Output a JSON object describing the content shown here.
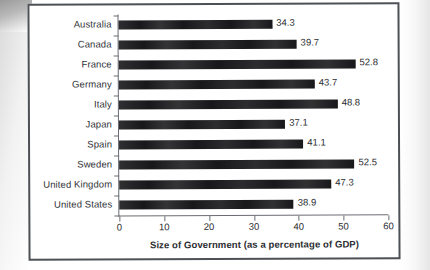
{
  "figure": {
    "border_color": "#4d5055",
    "background": "#ffffff"
  },
  "chart_data": {
    "type": "bar",
    "orientation": "horizontal",
    "title": "",
    "subtitle": "",
    "xlabel": "Size of Government (as a percentage of GDP)",
    "ylabel": "",
    "categories": [
      "Australia",
      "Canada",
      "France",
      "Germany",
      "Italy",
      "Japan",
      "Spain",
      "Sweden",
      "United Kingdom",
      "United States"
    ],
    "values": [
      34.3,
      39.7,
      52.8,
      43.7,
      48.8,
      37.1,
      41.1,
      52.5,
      47.3,
      38.9
    ],
    "data_labels": [
      "34.3",
      "39.7",
      "52.8",
      "43.7",
      "48.8",
      "37.1",
      "41.1",
      "52.5",
      "47.3",
      "38.9"
    ],
    "xlim": [
      0,
      60
    ],
    "xticks": [
      0,
      10,
      20,
      30,
      40,
      50,
      60
    ],
    "xtick_labels": [
      "0",
      "10",
      "20",
      "30",
      "40",
      "50",
      "60"
    ],
    "grid": false,
    "legend": null,
    "bar_color": "#18181a",
    "axis_color": "#6a6d72"
  }
}
